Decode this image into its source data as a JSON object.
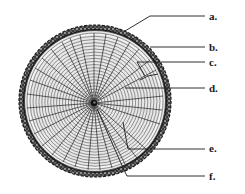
{
  "diagram": {
    "colors": {
      "background": "#ffffff",
      "ink": "#1a1a1a",
      "bark": "#2e2e2e",
      "wood": "#f4f4f4"
    },
    "labels": [
      {
        "id": "a",
        "text": "a.",
        "x": 209,
        "y": 11
      },
      {
        "id": "b",
        "text": "b.",
        "x": 209,
        "y": 42
      },
      {
        "id": "c",
        "text": "c.",
        "x": 209,
        "y": 57
      },
      {
        "id": "d",
        "text": "d.",
        "x": 209,
        "y": 83
      },
      {
        "id": "e",
        "text": "e.",
        "x": 209,
        "y": 143
      },
      {
        "id": "f",
        "text": "f.",
        "x": 209,
        "y": 172
      }
    ]
  }
}
